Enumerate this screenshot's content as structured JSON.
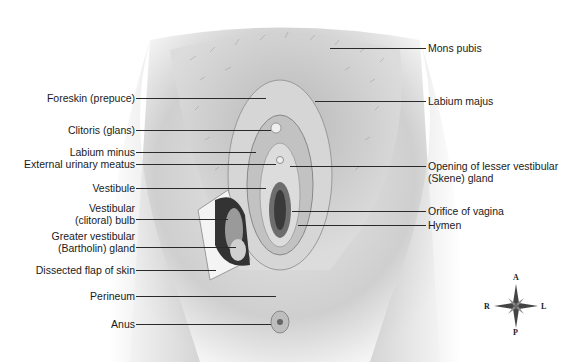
{
  "diagram": {
    "left_labels": [
      {
        "text": "Foreskin (prepuce)"
      },
      {
        "text": "Clitoris (glans)"
      },
      {
        "text": "Labium minus"
      },
      {
        "text": "External urinary meatus"
      },
      {
        "text": "Vestibule"
      },
      {
        "line1": "Vestibular",
        "line2": "(clitoral) bulb"
      },
      {
        "line1": "Greater vestibular",
        "line2": "(Bartholin) gland"
      },
      {
        "text": "Dissected flap of skin"
      },
      {
        "text": "Perineum"
      },
      {
        "text": "Anus"
      }
    ],
    "right_labels": [
      {
        "text": "Mons pubis"
      },
      {
        "text": "Labium majus"
      },
      {
        "line1": "Opening of lesser vestibular",
        "line2": "(Skene) gland"
      },
      {
        "text": "Orifice of vagina"
      },
      {
        "text": "Hymen"
      }
    ],
    "compass": {
      "top": "A",
      "bottom": "P",
      "left": "R",
      "right": "L"
    }
  }
}
